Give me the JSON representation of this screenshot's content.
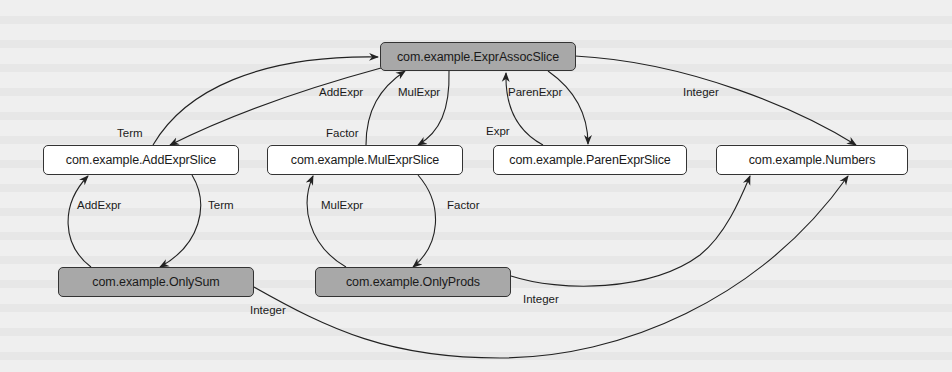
{
  "diagram": {
    "type": "dependency-graph",
    "colors": {
      "background": "#efefef",
      "node_root_fill": "#a8a8a8",
      "node_default_fill": "#ffffff",
      "node_border": "#333333",
      "edge": "#222222"
    },
    "nodes": [
      {
        "id": "expr_assoc",
        "label": "com.example.ExprAssocSlice",
        "style": "gray"
      },
      {
        "id": "add_expr",
        "label": "com.example.AddExprSlice",
        "style": "white"
      },
      {
        "id": "mul_expr",
        "label": "com.example.MulExprSlice",
        "style": "white"
      },
      {
        "id": "paren_expr",
        "label": "com.example.ParenExprSlice",
        "style": "white"
      },
      {
        "id": "numbers",
        "label": "com.example.Numbers",
        "style": "white"
      },
      {
        "id": "only_sum",
        "label": "com.example.OnlySum",
        "style": "gray"
      },
      {
        "id": "only_prods",
        "label": "com.example.OnlyProds",
        "style": "gray"
      }
    ],
    "edges": [
      {
        "from": "add_expr",
        "to": "expr_assoc",
        "label": "Term"
      },
      {
        "from": "expr_assoc",
        "to": "add_expr",
        "label": "AddExpr"
      },
      {
        "from": "mul_expr",
        "to": "expr_assoc",
        "label": "Factor"
      },
      {
        "from": "expr_assoc",
        "to": "mul_expr",
        "label": "MulExpr"
      },
      {
        "from": "paren_expr",
        "to": "expr_assoc",
        "label": "Expr"
      },
      {
        "from": "expr_assoc",
        "to": "paren_expr",
        "label": "ParenExpr"
      },
      {
        "from": "expr_assoc",
        "to": "numbers",
        "label": "Integer"
      },
      {
        "from": "only_sum",
        "to": "add_expr",
        "label": "AddExpr"
      },
      {
        "from": "add_expr",
        "to": "only_sum",
        "label": "Term"
      },
      {
        "from": "only_prods",
        "to": "mul_expr",
        "label": "MulExpr"
      },
      {
        "from": "mul_expr",
        "to": "only_prods",
        "label": "Factor"
      },
      {
        "from": "only_prods",
        "to": "numbers",
        "label": "Integer"
      },
      {
        "from": "only_sum",
        "to": "numbers",
        "label": "Integer"
      }
    ]
  }
}
